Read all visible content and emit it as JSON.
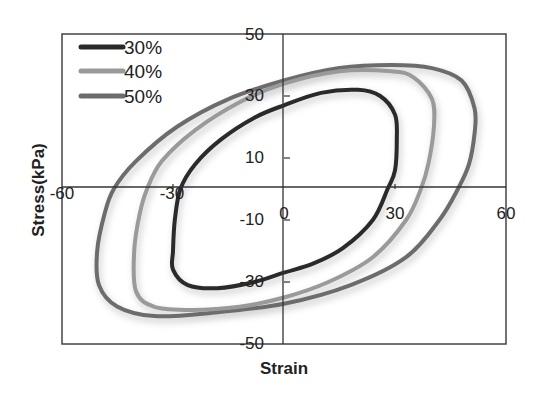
{
  "chart_data": {
    "type": "line",
    "title": "",
    "xlabel": "Strain",
    "ylabel": "Stress(kPa)",
    "xlim": [
      -60,
      60
    ],
    "ylim": [
      -50,
      50
    ],
    "x_ticks": [
      -60,
      -30,
      0,
      30,
      60
    ],
    "y_ticks": [
      50,
      30,
      10,
      -10,
      -30,
      -50
    ],
    "grid": false,
    "legend_position": "upper-left",
    "series": [
      {
        "name": "30%",
        "color": "#2a2a2a",
        "points": [
          [
            0,
            27
          ],
          [
            10,
            31
          ],
          [
            20,
            32
          ],
          [
            26,
            30
          ],
          [
            30,
            24
          ],
          [
            30.5,
            16
          ],
          [
            30,
            6
          ],
          [
            28,
            0
          ],
          [
            24,
            -10
          ],
          [
            16,
            -19
          ],
          [
            8,
            -24
          ],
          [
            0,
            -27
          ],
          [
            -8,
            -30
          ],
          [
            -18,
            -32
          ],
          [
            -26,
            -31
          ],
          [
            -30,
            -26
          ],
          [
            -30,
            -20
          ],
          [
            -29.5,
            -10
          ],
          [
            -28,
            0
          ],
          [
            -24,
            8
          ],
          [
            -17,
            16
          ],
          [
            -8,
            23
          ]
        ]
      },
      {
        "name": "40%",
        "color": "#9a9a9a",
        "points": [
          [
            0,
            34
          ],
          [
            15,
            38
          ],
          [
            29,
            38
          ],
          [
            35,
            36
          ],
          [
            40,
            29
          ],
          [
            40.5,
            20
          ],
          [
            39,
            8
          ],
          [
            37,
            0
          ],
          [
            33,
            -10
          ],
          [
            24,
            -22
          ],
          [
            12,
            -30
          ],
          [
            0,
            -35
          ],
          [
            -12,
            -38
          ],
          [
            -25,
            -39
          ],
          [
            -35,
            -38
          ],
          [
            -40,
            -33
          ],
          [
            -40.5,
            -20
          ],
          [
            -39,
            -8
          ],
          [
            -37,
            0
          ],
          [
            -33,
            9
          ],
          [
            -24,
            19
          ],
          [
            -12,
            28
          ]
        ]
      },
      {
        "name": "50%",
        "color": "#6c6c6c",
        "points": [
          [
            0,
            35
          ],
          [
            15,
            39
          ],
          [
            29,
            40
          ],
          [
            40,
            39
          ],
          [
            48,
            35
          ],
          [
            51.5,
            26
          ],
          [
            51.5,
            18
          ],
          [
            50,
            8
          ],
          [
            47,
            0
          ],
          [
            42,
            -10
          ],
          [
            33,
            -22
          ],
          [
            18,
            -31
          ],
          [
            0,
            -37
          ],
          [
            -20,
            -40
          ],
          [
            -35,
            -41
          ],
          [
            -45,
            -38
          ],
          [
            -50,
            -31
          ],
          [
            -50.5,
            -20
          ],
          [
            -48.5,
            -8
          ],
          [
            -46,
            0
          ],
          [
            -40,
            9
          ],
          [
            -29,
            20
          ],
          [
            -15,
            29
          ]
        ]
      }
    ]
  },
  "axis": {
    "x_title": "Strain",
    "y_title": "Stress(kPa)",
    "x_tick_labels": [
      "-60",
      "-30",
      "0",
      "30",
      "60"
    ],
    "y_tick_labels": [
      "50",
      "30",
      "10",
      "-10",
      "-30",
      "-50"
    ]
  },
  "legend": {
    "items": [
      {
        "label": "30%",
        "color": "#2a2a2a"
      },
      {
        "label": "40%",
        "color": "#9a9a9a"
      },
      {
        "label": "50%",
        "color": "#6c6c6c"
      }
    ]
  }
}
